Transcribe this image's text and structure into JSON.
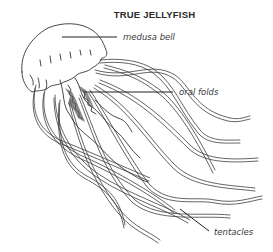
{
  "figure": {
    "title": "TRUE JELLYFISH",
    "labels": {
      "bell": "medusa bell",
      "oral": "oral folds",
      "tentacles": "tentacles"
    }
  },
  "colors": {
    "ink": "#333333",
    "background": "#ffffff"
  }
}
